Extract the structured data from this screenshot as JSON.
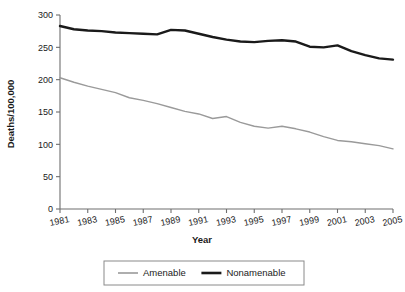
{
  "chart_data": {
    "type": "line",
    "title": "",
    "xlabel": "Year",
    "ylabel": "Deaths/100,000",
    "x": [
      1981,
      1982,
      1983,
      1984,
      1985,
      1986,
      1987,
      1988,
      1989,
      1990,
      1991,
      1992,
      1993,
      1994,
      1995,
      1996,
      1997,
      1998,
      1999,
      2000,
      2001,
      2002,
      2003,
      2004,
      2005
    ],
    "xlim": [
      1981,
      2005
    ],
    "ylim": [
      0,
      300
    ],
    "yticks": [
      0,
      50,
      100,
      150,
      200,
      250,
      300
    ],
    "xticks": [
      1981,
      1983,
      1985,
      1987,
      1989,
      1991,
      1993,
      1995,
      1997,
      1999,
      2001,
      2003,
      2005
    ],
    "xtick_labels": [
      "1981",
      "1983",
      "1985",
      "1987",
      "1989",
      "1991",
      "1993",
      "1995",
      "1997",
      "1999",
      "2001",
      "2003",
      "2005"
    ],
    "ytick_labels": [
      "0",
      "50",
      "100",
      "150",
      "200",
      "250",
      "300"
    ],
    "grid": false,
    "legend_position": "below",
    "series": [
      {
        "name": "Amenable",
        "color": "#9a9a9a",
        "width": 1.4,
        "values": [
          203,
          196,
          190,
          185,
          180,
          172,
          168,
          163,
          157,
          151,
          147,
          140,
          143,
          134,
          128,
          125,
          128,
          124,
          119,
          112,
          106,
          104,
          101,
          98,
          93
        ]
      },
      {
        "name": "Nonamenable",
        "color": "#1a1a1a",
        "width": 2.4,
        "values": [
          283,
          278,
          276,
          275,
          273,
          272,
          271,
          270,
          277,
          276,
          271,
          266,
          262,
          259,
          258,
          260,
          261,
          259,
          251,
          250,
          253,
          244,
          238,
          233,
          231
        ]
      }
    ]
  },
  "legend": {
    "items": [
      {
        "label": "Amenable",
        "color": "#9a9a9a",
        "width": 1.6
      },
      {
        "label": "Nonamenable",
        "color": "#1a1a1a",
        "width": 2.6
      }
    ]
  },
  "axis": {
    "x_title": "Year",
    "y_title": "Deaths/100,000"
  }
}
